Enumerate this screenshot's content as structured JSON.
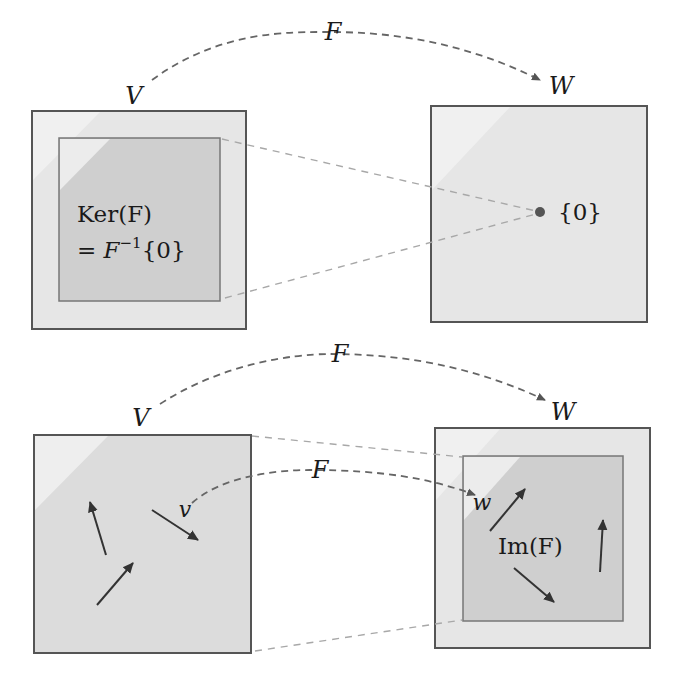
{
  "top_row": {
    "map_label": "F",
    "domain_label": "V",
    "codomain_label": "W",
    "kernel_label_line1": "Ker(F)",
    "kernel_label_line2_prefix": "= F",
    "kernel_label_line2_sup": "−1",
    "kernel_label_line2_suffix": "{0}",
    "zero_label": "{0}"
  },
  "bottom_row": {
    "map_label": "F",
    "domain_label": "V",
    "codomain_label": "W",
    "inner_map_label": "F",
    "vector_v_label": "v",
    "vector_w_label": "w",
    "image_label": "Im(F)"
  },
  "colors": {
    "outer_fill": "#e6e6e6",
    "inner_fill": "#cfcfcf",
    "border": "#555555",
    "arc": "#666666",
    "projection_line": "#a8a8a8",
    "zero_dot": "#555555"
  }
}
